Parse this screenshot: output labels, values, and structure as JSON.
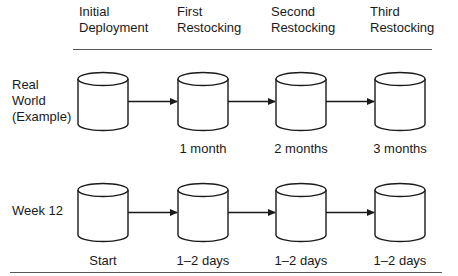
{
  "columns": [
    {
      "line1": "Initial",
      "line2": "Deployment"
    },
    {
      "line1": "First",
      "line2": "Restocking"
    },
    {
      "line1": "Second",
      "line2": "Restocking"
    },
    {
      "line1": "Third",
      "line2": "Restocking"
    }
  ],
  "rows": [
    {
      "label_lines": [
        "Real",
        "World",
        "(Example)"
      ],
      "captions": [
        "",
        "1 month",
        "2 months",
        "3 months"
      ]
    },
    {
      "label_lines": [
        "Week 12"
      ],
      "captions": [
        "Start",
        "1–2 days",
        "1–2 days",
        "1–2 days"
      ]
    }
  ],
  "colors": {
    "stroke": "#1a1a1a",
    "fill": "#ffffff",
    "rule": "#555555"
  }
}
